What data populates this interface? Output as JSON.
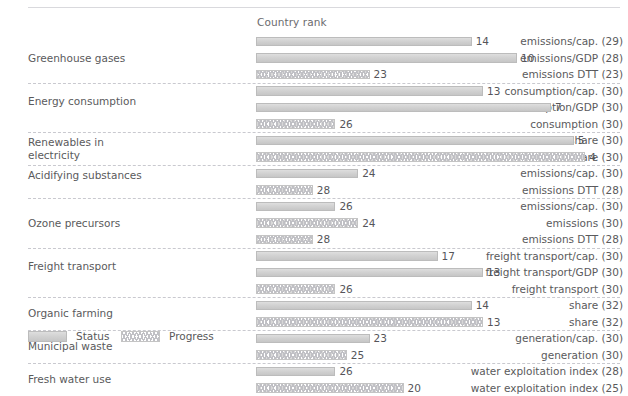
{
  "header": {
    "axis_title": "Country rank"
  },
  "legend": {
    "status_label": "Status",
    "progress_label": "Progress",
    "status_swatch_icon": "status-bar-swatch",
    "progress_swatch_icon": "progress-bar-swatch"
  },
  "colors": {
    "status_fill": "#d2d2d2",
    "status_border": "#bcbcbc",
    "progress_fill": "#ffffff",
    "progress_border": "#c4c4c4",
    "text": "#58585a",
    "separator": "#c9c9cf"
  },
  "chart_data": {
    "type": "bar",
    "title": "",
    "xlabel": "Country rank",
    "ylabel": "",
    "orientation": "horizontal",
    "xlim": [
      1,
      33
    ],
    "note": "Bar length is inversely proportional to rank: rank 1 is longest, rank 32 is shortest.",
    "grid": false,
    "legend_position": "bottom-left",
    "legend_entries": [
      "Status",
      "Progress"
    ],
    "groups": [
      {
        "group": "Greenhouse gases",
        "rows": [
          {
            "label": "emissions/cap. (29)",
            "indicator": "emissions/cap.",
            "countries": 29,
            "value": 14,
            "series": "Status"
          },
          {
            "label": "emissions/GDP (28)",
            "indicator": "emissions/GDP",
            "countries": 28,
            "value": 10,
            "series": "Status"
          },
          {
            "label": "emissions DTT (23)",
            "indicator": "emissions DTT",
            "countries": 23,
            "value": 23,
            "series": "Progress"
          }
        ]
      },
      {
        "group": "Energy consumption",
        "rows": [
          {
            "label": "consumption/cap. (30)",
            "indicator": "consumption/cap.",
            "countries": 30,
            "value": 13,
            "series": "Status"
          },
          {
            "label": "consumption/GDP (30)",
            "indicator": "consumption/GDP",
            "countries": 30,
            "value": 7,
            "series": "Status"
          },
          {
            "label": "consumption (30)",
            "indicator": "consumption",
            "countries": 30,
            "value": 26,
            "series": "Progress"
          }
        ]
      },
      {
        "group": "Renewables in electricity",
        "rows": [
          {
            "label": "share (30)",
            "indicator": "share",
            "countries": 30,
            "value": 5,
            "series": "Status"
          },
          {
            "label": "share (30)",
            "indicator": "share",
            "countries": 30,
            "value": 4,
            "series": "Progress"
          }
        ]
      },
      {
        "group": "Acidifying substances",
        "rows": [
          {
            "label": "emissions/cap. (30)",
            "indicator": "emissions/cap.",
            "countries": 30,
            "value": 24,
            "series": "Status"
          },
          {
            "label": "emissions DTT (28)",
            "indicator": "emissions DTT",
            "countries": 28,
            "value": 28,
            "series": "Progress"
          }
        ]
      },
      {
        "group": "Ozone precursors",
        "rows": [
          {
            "label": "emissions/cap. (30)",
            "indicator": "emissions/cap.",
            "countries": 30,
            "value": 26,
            "series": "Status"
          },
          {
            "label": "emissions (30)",
            "indicator": "emissions",
            "countries": 30,
            "value": 24,
            "series": "Progress"
          },
          {
            "label": "emissions DTT (28)",
            "indicator": "emissions DTT",
            "countries": 28,
            "value": 28,
            "series": "Progress"
          }
        ]
      },
      {
        "group": "Freight transport",
        "rows": [
          {
            "label": "freight transport/cap. (30)",
            "indicator": "freight transport/cap.",
            "countries": 30,
            "value": 17,
            "series": "Status"
          },
          {
            "label": "freight transport/GDP (30)",
            "indicator": "freight transport/GDP",
            "countries": 30,
            "value": 13,
            "series": "Status"
          },
          {
            "label": "freight transport (30)",
            "indicator": "freight transport",
            "countries": 30,
            "value": 26,
            "series": "Progress"
          }
        ]
      },
      {
        "group": "Organic farming",
        "rows": [
          {
            "label": "share (32)",
            "indicator": "share",
            "countries": 32,
            "value": 14,
            "series": "Status"
          },
          {
            "label": "share (32)",
            "indicator": "share",
            "countries": 32,
            "value": 13,
            "series": "Progress"
          }
        ]
      },
      {
        "group": "Municipal waste",
        "rows": [
          {
            "label": "generation/cap. (30)",
            "indicator": "generation/cap.",
            "countries": 30,
            "value": 23,
            "series": "Status"
          },
          {
            "label": "generation (30)",
            "indicator": "generation",
            "countries": 30,
            "value": 25,
            "series": "Progress"
          }
        ]
      },
      {
        "group": "Fresh water use",
        "rows": [
          {
            "label": "water exploitation index (28)",
            "indicator": "water exploitation index",
            "countries": 28,
            "value": 26,
            "series": "Status"
          },
          {
            "label": "water exploitation index (25)",
            "indicator": "water exploitation index",
            "countries": 25,
            "value": 20,
            "series": "Progress"
          }
        ]
      }
    ]
  }
}
